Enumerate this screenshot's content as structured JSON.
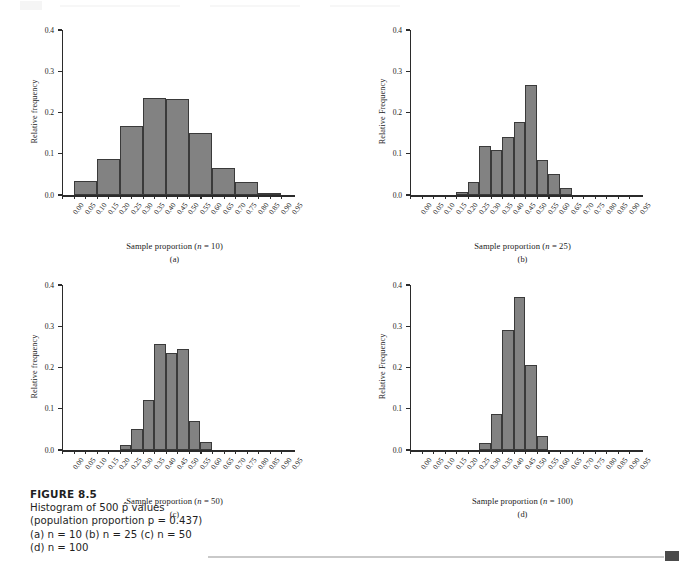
{
  "figure": {
    "label": "FIGURE 8.5",
    "caption_line1": "Histogram of 500 p̂ values",
    "caption_line2": "(population proportion p = 0.437)",
    "caption_line3": "(a) n = 10 (b) n = 25 (c) n = 50",
    "caption_line4": "(d) n = 100"
  },
  "axis": {
    "y_ticks": [
      "0.0",
      "0.1",
      "0.2",
      "0.3",
      "0.4"
    ],
    "y_values": [
      0.0,
      0.1,
      0.2,
      0.3,
      0.4
    ],
    "x_ticks": [
      "0.00",
      "0.05",
      "0.10",
      "0.15",
      "0.20",
      "0.25",
      "0.30",
      "0.35",
      "0.40",
      "0.45",
      "0.50",
      "0.55",
      "0.60",
      "0.65",
      "0.70",
      "0.75",
      "0.80",
      "0.85",
      "0.90",
      "0.95"
    ],
    "x_values": [
      0.0,
      0.05,
      0.1,
      0.15,
      0.2,
      0.25,
      0.3,
      0.35,
      0.4,
      0.45,
      0.5,
      0.55,
      0.6,
      0.65,
      0.7,
      0.75,
      0.8,
      0.85,
      0.9,
      0.95
    ]
  },
  "colors": {
    "bar_fill": "#828282",
    "bar_stroke": "#3a3a3a",
    "axis": "#2b2b2b",
    "text": "#1a1a1a",
    "footer_rule": "#c9c9c9",
    "footer_square": "#4b4b4b"
  },
  "panels": [
    {
      "key": "a",
      "letter": "(a)",
      "ylabel": "Relative frequency",
      "xlabel": "Sample proportion (n = 10)",
      "n": 10
    },
    {
      "key": "b",
      "letter": "(b)",
      "ylabel": "Relative Frequency",
      "xlabel": "Sample proportion (n = 25)",
      "n": 25
    },
    {
      "key": "c",
      "letter": "(c)",
      "ylabel": "Relative frequency",
      "xlabel": "Sample proportion (n = 50)",
      "n": 50
    },
    {
      "key": "d",
      "letter": "(d)",
      "ylabel": "Relative Frequency",
      "xlabel": "Sample proportion (n = 100)",
      "n": 100
    }
  ],
  "chart_data": [
    {
      "type": "bar",
      "title": "Sample proportion (n = 10)",
      "subtitle": "(a)",
      "xlabel": "Sample proportion (n = 10)",
      "ylabel": "Relative frequency",
      "xlim": [
        0.0,
        0.975
      ],
      "ylim": [
        0.0,
        0.4
      ],
      "grid": false,
      "legend": "none",
      "bin_width": 0.1,
      "bin_starts": [
        0.05,
        0.15,
        0.25,
        0.35,
        0.45,
        0.55,
        0.65,
        0.75,
        0.85
      ],
      "categories": [
        "0.05-0.15",
        "0.15-0.25",
        "0.25-0.35",
        "0.35-0.45",
        "0.45-0.55",
        "0.55-0.65",
        "0.65-0.75",
        "0.75-0.85",
        "0.85-0.95"
      ],
      "values": [
        0.034,
        0.088,
        0.168,
        0.236,
        0.233,
        0.15,
        0.065,
        0.031,
        0.006
      ]
    },
    {
      "type": "bar",
      "title": "Sample proportion (n = 25)",
      "subtitle": "(b)",
      "xlabel": "Sample proportion (n = 25)",
      "ylabel": "Relative Frequency",
      "xlim": [
        0.0,
        0.975
      ],
      "ylim": [
        0.0,
        0.4
      ],
      "grid": false,
      "legend": "none",
      "bin_width": 0.05,
      "bin_starts": [
        0.2,
        0.25,
        0.3,
        0.35,
        0.4,
        0.45,
        0.5,
        0.55,
        0.6,
        0.65
      ],
      "categories": [
        "0.20-0.25",
        "0.25-0.30",
        "0.30-0.35",
        "0.35-0.40",
        "0.40-0.45",
        "0.45-0.50",
        "0.50-0.55",
        "0.55-0.60",
        "0.60-0.65",
        "0.65-0.70"
      ],
      "values": [
        0.007,
        0.031,
        0.12,
        0.109,
        0.14,
        0.176,
        0.266,
        0.084,
        0.05,
        0.018
      ]
    },
    {
      "type": "bar",
      "title": "Sample proportion (n = 50)",
      "subtitle": "(c)",
      "xlabel": "Sample proportion (n = 50)",
      "ylabel": "Relative frequency",
      "xlim": [
        0.0,
        0.975
      ],
      "ylim": [
        0.0,
        0.4
      ],
      "grid": false,
      "legend": "none",
      "bin_width": 0.05,
      "bin_starts": [
        0.25,
        0.3,
        0.35,
        0.4,
        0.45,
        0.5,
        0.55,
        0.6
      ],
      "categories": [
        "0.25-0.30",
        "0.30-0.35",
        "0.35-0.40",
        "0.40-0.45",
        "0.45-0.50",
        "0.50-0.55",
        "0.55-0.60",
        "0.60-0.65"
      ],
      "values": [
        0.012,
        0.05,
        0.122,
        0.257,
        0.235,
        0.245,
        0.07,
        0.02
      ]
    },
    {
      "type": "bar",
      "title": "Sample proportion (n = 100)",
      "subtitle": "(d)",
      "xlabel": "Sample proportion (n = 100)",
      "ylabel": "Relative Frequency",
      "xlim": [
        0.0,
        0.975
      ],
      "ylim": [
        0.0,
        0.4
      ],
      "grid": false,
      "legend": "none",
      "bin_width": 0.05,
      "bin_starts": [
        0.3,
        0.35,
        0.4,
        0.45,
        0.5,
        0.55
      ],
      "categories": [
        "0.30-0.35",
        "0.35-0.40",
        "0.40-0.45",
        "0.45-0.50",
        "0.50-0.55",
        "0.55-0.60"
      ],
      "values": [
        0.018,
        0.088,
        0.291,
        0.372,
        0.205,
        0.033
      ]
    }
  ]
}
